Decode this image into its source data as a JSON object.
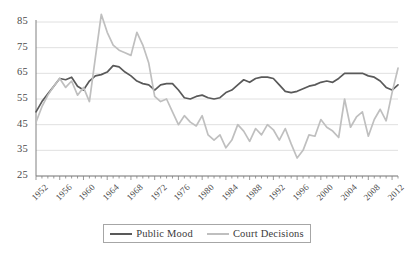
{
  "chart_data": {
    "type": "line",
    "title": "",
    "xlabel": "",
    "ylabel": "",
    "ylim": [
      25,
      85
    ],
    "yticks": [
      25,
      35,
      45,
      55,
      65,
      75,
      85
    ],
    "grid": true,
    "legend_position": "bottom",
    "xlim": [
      1952,
      2013
    ],
    "xticks": [
      1952,
      1956,
      1960,
      1964,
      1968,
      1972,
      1976,
      1980,
      1984,
      1988,
      1992,
      1996,
      2000,
      2004,
      2008,
      2012
    ],
    "x": [
      1952,
      1953,
      1954,
      1955,
      1956,
      1957,
      1958,
      1959,
      1960,
      1961,
      1962,
      1963,
      1964,
      1965,
      1966,
      1967,
      1968,
      1969,
      1970,
      1971,
      1972,
      1973,
      1974,
      1975,
      1976,
      1977,
      1978,
      1979,
      1980,
      1981,
      1982,
      1983,
      1984,
      1985,
      1986,
      1987,
      1988,
      1989,
      1990,
      1991,
      1992,
      1993,
      1994,
      1995,
      1996,
      1997,
      1998,
      1999,
      2000,
      2001,
      2002,
      2003,
      2004,
      2005,
      2006,
      2007,
      2008,
      2009,
      2010,
      2011,
      2012,
      2013
    ],
    "series": [
      {
        "name": "Public Mood",
        "color": "#595959",
        "values": [
          50,
          54,
          57,
          60,
          63,
          62.5,
          63.5,
          60,
          58.5,
          62,
          64,
          64.5,
          65.5,
          68,
          67.5,
          65.5,
          64,
          62,
          61,
          60.5,
          58.5,
          60.5,
          61,
          61,
          58.5,
          55.5,
          55,
          56,
          56.5,
          55.5,
          55,
          55.5,
          57.5,
          58.5,
          60.5,
          62.5,
          61.5,
          63,
          63.5,
          63.5,
          63,
          60.5,
          58,
          57.5,
          58,
          59,
          60,
          60.5,
          61.5,
          62,
          61.5,
          63,
          65,
          65,
          65,
          65,
          64,
          63.5,
          62,
          59.5,
          58.5,
          60.5
        ]
      },
      {
        "name": "Court Decisions",
        "color": "#bfbfbf",
        "values": [
          46,
          52,
          56.5,
          60,
          63,
          59.5,
          62,
          56.5,
          59.5,
          54,
          71,
          88,
          81,
          76,
          74,
          73,
          72,
          81,
          76,
          69,
          56,
          54,
          55,
          50,
          45,
          48.5,
          46,
          44.5,
          48.5,
          41,
          39,
          41,
          36,
          39,
          45,
          42.5,
          38.5,
          43.5,
          41,
          45,
          43,
          39,
          43.5,
          37.5,
          32,
          35,
          41,
          40.5,
          47,
          44,
          42.5,
          40,
          55,
          44,
          48,
          50,
          40.5,
          47,
          51,
          46.5,
          57.5,
          67
        ]
      }
    ]
  },
  "legend": {
    "items": [
      {
        "label": "Public Mood",
        "key": "mood"
      },
      {
        "label": "Court Decisions",
        "key": "court"
      }
    ]
  },
  "colors": {
    "public_mood": "#595959",
    "court_decisions": "#bfbfbf",
    "grid": "#e0e0e0",
    "axis": "#808080",
    "text": "#3a3a3a"
  }
}
